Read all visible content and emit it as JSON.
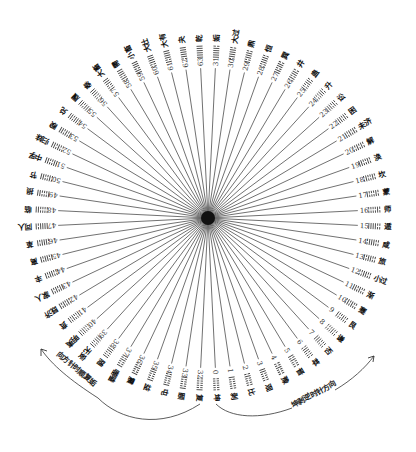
{
  "diagram": {
    "title": "",
    "center": {
      "x": 208,
      "y": 218
    },
    "spoke_inner_radius": 0,
    "spoke_outer_radius": 150,
    "label_radius": 168,
    "start_angle_deg": 92.8,
    "direction_note": "index 0 at bottom, increasing counterclockwise through right side to top; 32-63 on left side",
    "colors": {
      "ink": "#222222",
      "spoke": "#333333",
      "background": "#ffffff"
    },
    "hexagrams": [
      {
        "n": 0,
        "name": "坤"
      },
      {
        "n": 1,
        "name": "剥"
      },
      {
        "n": 2,
        "name": "比"
      },
      {
        "n": 3,
        "name": "观"
      },
      {
        "n": 4,
        "name": "豫"
      },
      {
        "n": 5,
        "name": "晋"
      },
      {
        "n": 6,
        "name": "萃"
      },
      {
        "n": 7,
        "name": "否"
      },
      {
        "n": 8,
        "name": "谦"
      },
      {
        "n": 9,
        "name": "艮"
      },
      {
        "n": 10,
        "name": "蹇"
      },
      {
        "n": 11,
        "name": "渐"
      },
      {
        "n": 12,
        "name": "小过"
      },
      {
        "n": 13,
        "name": "旅"
      },
      {
        "n": 14,
        "name": "咸"
      },
      {
        "n": 15,
        "name": "遁"
      },
      {
        "n": 16,
        "name": "师"
      },
      {
        "n": 17,
        "name": "蒙"
      },
      {
        "n": 18,
        "name": "坎"
      },
      {
        "n": 19,
        "name": "涣"
      },
      {
        "n": 20,
        "name": "解"
      },
      {
        "n": 21,
        "name": "未济"
      },
      {
        "n": 22,
        "name": "困"
      },
      {
        "n": 23,
        "name": "讼"
      },
      {
        "n": 24,
        "name": "升"
      },
      {
        "n": 25,
        "name": "蛊"
      },
      {
        "n": 26,
        "name": "井"
      },
      {
        "n": 27,
        "name": "巽"
      },
      {
        "n": 28,
        "name": "恒"
      },
      {
        "n": 29,
        "name": "鼎"
      },
      {
        "n": 30,
        "name": "大过"
      },
      {
        "n": 31,
        "name": "姤"
      },
      {
        "n": 32,
        "name": "复"
      },
      {
        "n": 33,
        "name": "颐"
      },
      {
        "n": 34,
        "name": "屯"
      },
      {
        "n": 35,
        "name": "益"
      },
      {
        "n": 36,
        "name": "震"
      },
      {
        "n": 37,
        "name": "噬嗑"
      },
      {
        "n": 38,
        "name": "随"
      },
      {
        "n": 39,
        "name": "无妄"
      },
      {
        "n": 40,
        "name": "明夷"
      },
      {
        "n": 41,
        "name": "贲"
      },
      {
        "n": 42,
        "name": "既济"
      },
      {
        "n": 43,
        "name": "家人"
      },
      {
        "n": 44,
        "name": "丰"
      },
      {
        "n": 45,
        "name": "离"
      },
      {
        "n": 46,
        "name": "革"
      },
      {
        "n": 47,
        "name": "同人"
      },
      {
        "n": 48,
        "name": "临"
      },
      {
        "n": 49,
        "name": "损"
      },
      {
        "n": 50,
        "name": "节"
      },
      {
        "n": 51,
        "name": "中孚"
      },
      {
        "n": 52,
        "name": "归妹"
      },
      {
        "n": 53,
        "name": "睽"
      },
      {
        "n": 54,
        "name": "兑"
      },
      {
        "n": 55,
        "name": "履"
      },
      {
        "n": 56,
        "name": "泰"
      },
      {
        "n": 57,
        "name": "大畜"
      },
      {
        "n": 58,
        "name": "需"
      },
      {
        "n": 59,
        "name": "小畜"
      },
      {
        "n": 60,
        "name": "大壮"
      },
      {
        "n": 61,
        "name": "大有"
      },
      {
        "n": 62,
        "name": "夬"
      },
      {
        "n": 63,
        "name": "乾"
      }
    ],
    "arrows": {
      "left": {
        "label": "向方针时顺复姤",
        "direction": "clockwise",
        "arrow_tip": {
          "x": 40,
          "y": 348
        }
      },
      "right": {
        "label": "逆时针方向",
        "prefix": "坤剥",
        "full_label": "坤剥逆时针方向",
        "direction": "counterclockwise",
        "arrow_tip": {
          "x": 375,
          "y": 355
        }
      }
    }
  }
}
